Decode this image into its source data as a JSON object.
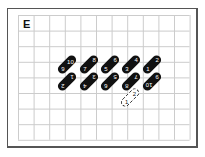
{
  "panel_label": "E",
  "grid": {
    "cols": 11,
    "rows": 8,
    "cell": 15.6,
    "line_color": "#cccccc"
  },
  "pills_top": [
    {
      "a": "9",
      "b": "10",
      "x": 56,
      "y": 60
    },
    {
      "a": "7",
      "b": "8",
      "x": 78,
      "y": 60
    },
    {
      "a": "5",
      "b": "6",
      "x": 99,
      "y": 60
    },
    {
      "a": "3",
      "b": "4",
      "x": 120,
      "y": 60
    },
    {
      "a": "1",
      "b": "2",
      "x": 141,
      "y": 60
    }
  ],
  "pills_bottom": [
    {
      "a": "2",
      "b": "1",
      "x": 56,
      "y": 77
    },
    {
      "a": "4",
      "b": "3",
      "x": 78,
      "y": 77
    },
    {
      "a": "6",
      "b": "5",
      "x": 99,
      "y": 77
    },
    {
      "a": "8",
      "b": "7",
      "x": 120,
      "y": 77
    },
    {
      "a": "10",
      "b": "9",
      "x": 141,
      "y": 77
    }
  ],
  "dashed_pill": {
    "a": "1",
    "b": "2",
    "x": 119,
    "y": 93
  }
}
